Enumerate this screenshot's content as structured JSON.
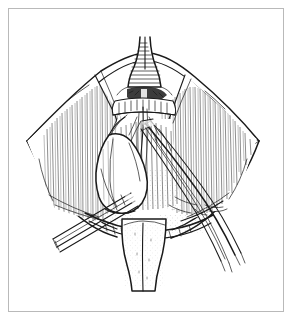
{
  "figure": {
    "domain": "anatomical-line-illustration",
    "title": "Surgical exposure line drawing",
    "frame": {
      "visible": true,
      "border_color": "#b9b9b9",
      "background_color": "#ffffff",
      "inset_px": 8
    },
    "ink_color": "#1a1a1a",
    "paper_color": "#ffffff",
    "elements": [
      {
        "name": "upper-tubular-structure",
        "label": "Upper tubular structure (trachea/larynx)",
        "position": "top-center"
      },
      {
        "name": "transverse-band",
        "label": "Transverse banded segment with dark notch",
        "position": "upper-center"
      },
      {
        "name": "left-tissue-flap",
        "label": "Left retracted tissue flap",
        "position": "left"
      },
      {
        "name": "right-tissue-flap",
        "label": "Right retracted tissue flap",
        "position": "right"
      },
      {
        "name": "lobed-mass",
        "label": "Pale lobed mass (gland lobe)",
        "position": "lower-left-center"
      },
      {
        "name": "lower-tubular-structure",
        "label": "Lower tubular structure",
        "position": "bottom-center"
      },
      {
        "name": "left-instrument",
        "label": "Surgical instrument entering lower left",
        "position": "lower-left"
      },
      {
        "name": "right-instrument",
        "label": "Surgical forceps entering lower right",
        "position": "lower-right"
      },
      {
        "name": "field-margin",
        "label": "Diamond-shaped wound margin",
        "position": "full-field"
      }
    ]
  }
}
